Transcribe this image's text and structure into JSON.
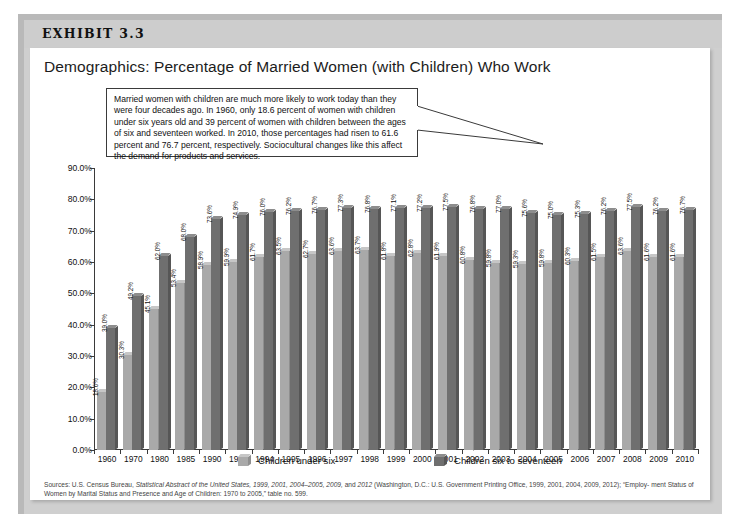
{
  "exhibit": {
    "label": "EXHIBIT 3.3",
    "title": "Demographics: Percentage of Married Women (with Children) Who Work"
  },
  "callout": {
    "text": "Married women with children are much more likely to work today than they were four decades ago. In 1960, only 18.6 percent of women with children under six years old and 39 percent of women with children between the ages of six and seventeen worked. In 2010, those percentages had risen to 61.6 percent and 76.7 percent, respectively. Sociocultural changes like this affect the demand for products and services."
  },
  "sources": {
    "line1_pre": "Sources: U.S. Census Bureau, ",
    "line1_italic": "Statistical Abstract of the United States, 1999, 2001, 2004–2005, 2009,",
    "line1_mid": " and ",
    "line1_italic2": "2012",
    "line1_post": " (Washington, D.C.: U.S. Government Printing Office, 1999, 2001, 2004, 2009, 2012); “Employ-",
    "line2": "ment Status of Women by Marital Status and Presence and Age of Children: 1970 to 2005,” table no. 599."
  },
  "colors": {
    "light_bar": "#a9a9a9",
    "dark_bar": "#6f6f6f",
    "axis": "#3a3a3a",
    "band": "#cdcdcd",
    "page_bg": "#ffffff"
  },
  "chart_data": {
    "type": "bar",
    "title": "Demographics: Percentage of Married Women (with Children) Who Work",
    "xlabel": "",
    "ylabel": "",
    "ylim": [
      0,
      90
    ],
    "ytick_labels": [
      "90.0%",
      "80.0%",
      "70.0%",
      "60.0%",
      "50.0%",
      "40.0%",
      "30.0%",
      "20.0%",
      "10.0%",
      "0.0%"
    ],
    "ytick_values": [
      90,
      80,
      70,
      60,
      50,
      40,
      30,
      20,
      10,
      0
    ],
    "grid": false,
    "legend_position": "bottom",
    "categories": [
      "1960",
      "1970",
      "1980",
      "1985",
      "1990",
      "1993",
      "1994",
      "1995",
      "1996",
      "1997",
      "1998",
      "1999",
      "2000",
      "2001",
      "2002",
      "2003",
      "2004",
      "2005",
      "2006",
      "2007",
      "2008",
      "2009",
      "2010"
    ],
    "series": [
      {
        "name": "Children under six",
        "color": "#a9a9a9",
        "values": [
          18.6,
          30.3,
          45.1,
          53.4,
          58.9,
          59.9,
          61.7,
          63.5,
          62.7,
          63.6,
          63.7,
          61.8,
          62.8,
          61.9,
          60.8,
          59.8,
          59.3,
          59.8,
          60.3,
          61.5,
          63.6,
          61.6,
          61.6
        ],
        "labels": [
          "18.6%",
          "30.3%",
          "45.1%",
          "53.4%",
          "58.9%",
          "59.9%",
          "61.7%",
          "63.5%",
          "62.7%",
          "63.6%",
          "63.7%",
          "61.8%",
          "62.8%",
          "61.9%",
          "60.8%",
          "59.8%",
          "59.3%",
          "59.8%",
          "60.3%",
          "61.5%",
          "63.6%",
          "61.6%",
          "61.6%"
        ]
      },
      {
        "name": "Children six to seventeen",
        "color": "#6f6f6f",
        "values": [
          39.0,
          49.2,
          62.0,
          68.0,
          73.6,
          74.9,
          76.0,
          76.2,
          76.7,
          77.3,
          76.8,
          77.1,
          77.2,
          77.5,
          76.8,
          77.0,
          75.6,
          75.0,
          75.3,
          76.2,
          77.5,
          76.2,
          76.7
        ],
        "labels": [
          "39.0%",
          "49.2%",
          "62.0%",
          "68.0%",
          "73.6%",
          "74.9%",
          "76.0%",
          "76.2%",
          "76.7%",
          "77.3%",
          "76.8%",
          "77.1%",
          "77.2%",
          "77.5%",
          "76.8%",
          "77.0%",
          "75.6%",
          "75.0%",
          "75.3%",
          "76.2%",
          "77.5%",
          "76.2%",
          "76.7%"
        ]
      }
    ]
  },
  "legend": [
    {
      "label": "Children under six"
    },
    {
      "label": "Children six to seventeen"
    }
  ]
}
